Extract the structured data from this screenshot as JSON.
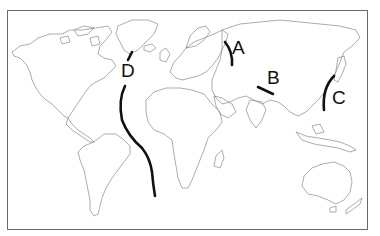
{
  "map": {
    "type": "world-outline-map",
    "frame": {
      "x": 7,
      "y": 10,
      "width": 361,
      "height": 220,
      "border_color": "#6a6a6a"
    },
    "coastline_color": "#8a8a8a",
    "marker_color": "#111111",
    "labels": [
      {
        "id": "A",
        "text": "A",
        "x": 232,
        "y": 38
      },
      {
        "id": "B",
        "text": "B",
        "x": 267,
        "y": 68
      },
      {
        "id": "C",
        "text": "C",
        "x": 332,
        "y": 88
      },
      {
        "id": "D",
        "text": "D",
        "x": 121,
        "y": 61
      }
    ],
    "markers": [
      {
        "id": "A",
        "description": "curved line near Ural region"
      },
      {
        "id": "B",
        "description": "short line near Himalaya/Tibet region"
      },
      {
        "id": "C",
        "description": "arc along East Asian island arc"
      },
      {
        "id": "D",
        "description": "long line through Atlantic Ocean (Mid-Atlantic)"
      }
    ]
  }
}
